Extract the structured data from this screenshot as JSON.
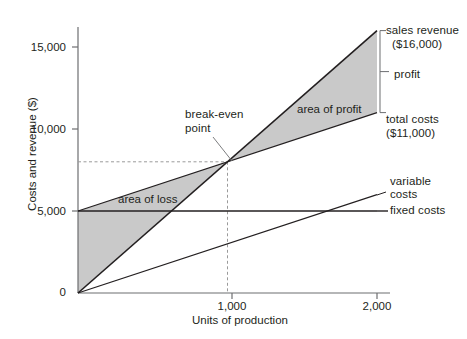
{
  "chart_data": {
    "type": "line",
    "title": "",
    "xlabel": "Units of production",
    "ylabel": "Costs and revenue ($)",
    "xlim": [
      0,
      2100
    ],
    "ylim": [
      0,
      17500
    ],
    "xticks": [
      {
        "value": 0,
        "label": "0"
      },
      {
        "value": 1000,
        "label": "1,000"
      },
      {
        "value": 2000,
        "label": "2,000"
      }
    ],
    "yticks": [
      {
        "value": 0,
        "label": "0"
      },
      {
        "value": 5000,
        "label": "5,000"
      },
      {
        "value": 10000,
        "label": "10,000"
      },
      {
        "value": 15000,
        "label": "15,000"
      }
    ],
    "grid": false,
    "legend_position": "right-inline",
    "series": [
      {
        "name": "sales revenue",
        "points": [
          [
            0,
            0
          ],
          [
            2000,
            16000
          ]
        ],
        "end_value": 16000,
        "end_value_label": "($16,000)"
      },
      {
        "name": "total costs",
        "points": [
          [
            0,
            5000
          ],
          [
            2000,
            11000
          ]
        ],
        "end_value": 11000,
        "end_value_label": "($11,000)"
      },
      {
        "name": "variable costs",
        "points": [
          [
            0,
            0
          ],
          [
            2000,
            6000
          ]
        ],
        "end_value": 6000
      },
      {
        "name": "fixed costs",
        "points": [
          [
            0,
            5000
          ],
          [
            2000,
            5000
          ]
        ],
        "end_value": 5000
      }
    ],
    "annotations": [
      {
        "name": "break-even point",
        "x": 1000,
        "y": 8000
      },
      {
        "name": "area of profit",
        "x": 1550,
        "y": 11700
      },
      {
        "name": "area of loss",
        "x": 400,
        "y": 5600
      },
      {
        "name": "profit",
        "x": 2000,
        "y": 13500
      }
    ],
    "shaded_regions": [
      {
        "name": "area of profit",
        "from_x": 1000,
        "to_x": 2000,
        "fill": "#c9c9c9"
      },
      {
        "name": "area of loss",
        "from_x": 0,
        "to_x": 1000,
        "fill": "#c9c9c9"
      }
    ],
    "breakeven": {
      "units": 1000,
      "amount": 8000
    }
  },
  "axes": {
    "y_title": "Costs and revenue ($)",
    "x_title": "Units of production",
    "y_tick_0": "0",
    "y_tick_5000": "5,000",
    "y_tick_10000": "10,000",
    "y_tick_15000": "15,000",
    "x_tick_1000": "1,000",
    "x_tick_2000": "2,000"
  },
  "labels": {
    "sales_revenue": "sales revenue",
    "sales_revenue_value": "($16,000)",
    "profit": "profit",
    "total_costs": "total costs",
    "total_costs_value": "($11,000)",
    "variable": "variable",
    "variable_costs": "costs",
    "fixed_costs": "fixed costs",
    "break_even_line1": "break-even",
    "break_even_line2": "point",
    "area_of_profit": "area of profit",
    "area_of_loss": "area of loss"
  },
  "colors": {
    "line": "#231f20",
    "shade": "#c9c9c9",
    "axis": "#6d6e71",
    "dashed": "#9a9a9a",
    "text": "#231f20"
  }
}
